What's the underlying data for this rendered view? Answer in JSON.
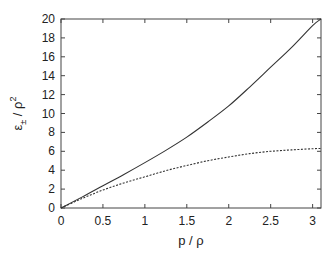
{
  "chart_data": {
    "type": "line",
    "title": "",
    "xlabel": "p / ρ",
    "ylabel": "ε± / ρ²",
    "ylabel_parts": {
      "base": "ε",
      "sub": "±",
      "mid": " / ρ",
      "sup": "2"
    },
    "xlim": [
      0,
      3.1
    ],
    "ylim": [
      0,
      20
    ],
    "xticks": [
      0,
      0.5,
      1,
      1.5,
      2,
      2.5,
      3
    ],
    "xtick_labels": [
      "0",
      "0.5",
      "1",
      "1.5",
      "2",
      "2.5",
      "3"
    ],
    "yticks": [
      0,
      2,
      4,
      6,
      8,
      10,
      12,
      14,
      16,
      18,
      20
    ],
    "ytick_labels": [
      "0",
      "2",
      "4",
      "6",
      "8",
      "10",
      "12",
      "14",
      "16",
      "18",
      "20"
    ],
    "grid": false,
    "legend": null,
    "series": [
      {
        "name": "ε+ (solid)",
        "style": "solid",
        "color": "#333333",
        "x": [
          0,
          0.25,
          0.5,
          0.75,
          1,
          1.25,
          1.5,
          1.75,
          2,
          2.25,
          2.5,
          2.75,
          3,
          3.1
        ],
        "y": [
          0,
          1.15,
          2.35,
          3.55,
          4.8,
          6.1,
          7.5,
          9.1,
          10.8,
          12.8,
          14.9,
          17.0,
          19.3,
          20.0
        ]
      },
      {
        "name": "ε− (dashed)",
        "style": "dashed",
        "color": "#333333",
        "x": [
          0,
          0.25,
          0.5,
          0.75,
          1,
          1.25,
          1.5,
          1.75,
          2,
          2.25,
          2.5,
          2.75,
          3,
          3.1
        ],
        "y": [
          0,
          1.0,
          1.9,
          2.65,
          3.3,
          3.95,
          4.5,
          5.0,
          5.4,
          5.75,
          6.0,
          6.15,
          6.27,
          6.3
        ]
      }
    ]
  },
  "layout": {
    "plot_left": 61,
    "plot_right": 321,
    "plot_top": 19,
    "plot_bottom": 208
  }
}
